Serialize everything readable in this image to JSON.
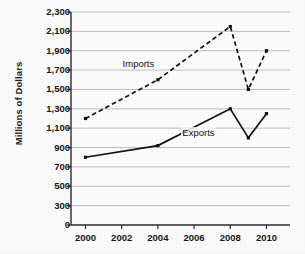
{
  "chart_data": {
    "type": "line",
    "title": "",
    "xlabel": "",
    "ylabel": "Millions of Dollars",
    "x": [
      2000,
      2004,
      2008,
      2009,
      2010
    ],
    "xlim": [
      1999.2,
      2011.3
    ],
    "ylim": [
      0,
      2400
    ],
    "grid": true,
    "legend_position": "inline-annotation",
    "xticks": [
      "2000",
      "2002",
      "2004",
      "2006",
      "2008",
      "2010"
    ],
    "xtick_values": [
      2000,
      2002,
      2004,
      2006,
      2008,
      2010
    ],
    "yticks": [
      "0",
      "300",
      "500",
      "700",
      "900",
      "1,100",
      "1,300",
      "1,500",
      "1,700",
      "1,900",
      "2,100",
      "2,300"
    ],
    "ytick_values": [
      0,
      300,
      500,
      700,
      900,
      1100,
      1300,
      1500,
      1700,
      1900,
      2100,
      2300
    ],
    "series": [
      {
        "name": "Imports",
        "style": "dashed",
        "color": "#111111",
        "values": [
          1200,
          1600,
          2150,
          1500,
          1900
        ]
      },
      {
        "name": "Exports",
        "style": "solid",
        "color": "#111111",
        "values": [
          800,
          920,
          1300,
          1000,
          1250
        ]
      }
    ],
    "annotations": [
      {
        "text": "Imports",
        "x": 2003.1,
        "y": 1760
      },
      {
        "text": "Exports",
        "x": 2006.4,
        "y": 1055
      }
    ]
  },
  "colors": {
    "axis": "#2b2b2b",
    "grid": "#b8b8b8",
    "series": "#111111",
    "background": "#fbfbfb",
    "text": "#161616"
  }
}
